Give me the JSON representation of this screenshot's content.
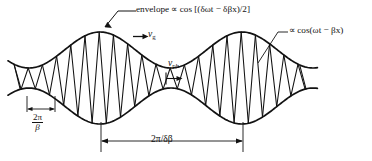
{
  "figure": {
    "width": 372,
    "height": 161,
    "background_color": "#ffffff",
    "ink_color": "#121212"
  },
  "labels": {
    "envelope": "envelope ∝ cos [(δωt − δβx)/2]",
    "carrier": "∝ cos(ωt − βx)",
    "group_velocity_symbol": "v",
    "group_velocity_subscript": "g",
    "phase_velocity_symbol": "v",
    "phase_velocity_subscript": "ph",
    "carrier_period_numerator": "2π",
    "carrier_period_denominator": "β",
    "beat_period": "2π/δβ"
  },
  "chart_data": {
    "type": "line",
    "xlabel": "",
    "ylabel": "",
    "grid": false,
    "legend_position": "none",
    "axis_ranges": {
      "x": [
        0,
        372
      ],
      "y": [
        0,
        161
      ]
    },
    "annotations": [
      {
        "name": "envelope-label",
        "text": "envelope ∝ cos [(δωt − δβx)/2]",
        "x": 136,
        "y": 10,
        "leader_from": [
          136,
          11
        ],
        "leader_to": [
          103,
          30
        ]
      },
      {
        "name": "carrier-label",
        "text": "∝ cos(ωt − βx)",
        "x": 289,
        "y": 31,
        "leader_from": [
          288,
          32
        ],
        "leader_to": [
          259,
          62
        ]
      },
      {
        "name": "group-velocity-label",
        "text": "v_g",
        "x": 148,
        "y": 34,
        "arrow_from": [
          133,
          36
        ],
        "arrow_to": [
          147,
          36
        ]
      },
      {
        "name": "phase-velocity-label",
        "text": "v_ph",
        "x": 168,
        "y": 63,
        "arrow_from": [
          166,
          79
        ],
        "arrow_to": [
          181,
          79
        ]
      },
      {
        "name": "carrier-period-dimension",
        "text": "2π/β",
        "x": 40,
        "y": 118,
        "extent_from": [
          27,
          100
        ],
        "extent_to": [
          55,
          100
        ]
      },
      {
        "name": "beat-period-dimension",
        "text": "2π/δβ",
        "x": 172,
        "y": 139,
        "extent_from": [
          101,
          141
        ],
        "extent_to": [
          243,
          141
        ]
      }
    ],
    "envelope": {
      "description": "Slow cosine envelope; carrier oscillation is bounded between the upper envelope and its mirror image (lower envelope).",
      "center_y": 78,
      "mean_amplitude": 28,
      "modulation_depth": 18,
      "beat_wavelength_px": 142,
      "beat_phase_peak_x": [
        100,
        242
      ],
      "beat_phase_node_x": [
        29,
        171,
        313
      ]
    },
    "carrier": {
      "description": "Fast zigzag carrier drawn as straight segments alternately touching upper and lower envelope.",
      "half_period_px": 7.1,
      "wavelength_px": 14.2,
      "x_start": 14,
      "x_end": 306
    }
  }
}
